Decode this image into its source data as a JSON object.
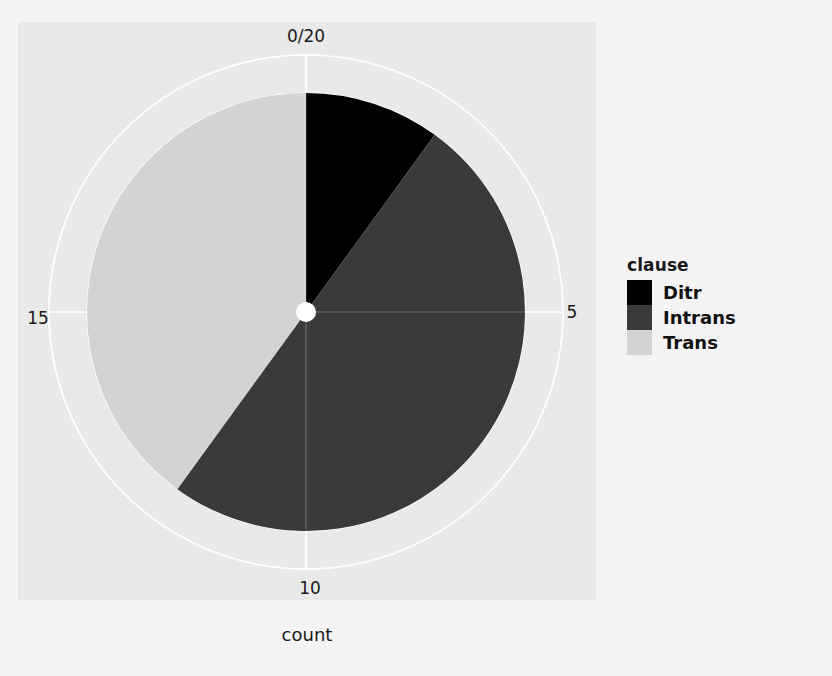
{
  "figure": {
    "axis_title": "count",
    "panel_color": "#e9e9e9",
    "background_color": "#f4f4f4",
    "grid_color": "#ffffff",
    "center_dot_color": "#ffffff"
  },
  "legend": {
    "title": "clause",
    "entries": [
      {
        "label": "Ditr",
        "color": "#000000"
      },
      {
        "label": "Intrans",
        "color": "#3a3a3a"
      },
      {
        "label": "Trans",
        "color": "#d3d3d3"
      }
    ]
  },
  "axis": {
    "ticks": [
      {
        "label": "0/20",
        "value": 0,
        "position": "top"
      },
      {
        "label": "5",
        "value": 5,
        "position": "right"
      },
      {
        "label": "10",
        "value": 10,
        "position": "bottom"
      },
      {
        "label": "15",
        "value": 15,
        "position": "left"
      }
    ]
  },
  "chart_data": {
    "type": "pie",
    "title": "",
    "xlabel": "count",
    "ylabel": "",
    "total": 20,
    "angular_axis_max": 20,
    "start_angle_deg": 0,
    "direction": "clockwise",
    "grid": true,
    "legend_position": "right",
    "legend_title": "clause",
    "categories": [
      "Ditr",
      "Intrans",
      "Trans"
    ],
    "values": [
      2,
      10,
      8
    ],
    "colors": [
      "#000000",
      "#3a3a3a",
      "#d3d3d3"
    ],
    "slices": [
      {
        "label": "Ditr",
        "value": 2,
        "color": "#000000",
        "start_deg": 0,
        "end_deg": 36
      },
      {
        "label": "Intrans",
        "value": 10,
        "color": "#3a3a3a",
        "start_deg": 36,
        "end_deg": 216
      },
      {
        "label": "Trans",
        "value": 8,
        "color": "#d3d3d3",
        "start_deg": 216,
        "end_deg": 360
      }
    ]
  },
  "geometry": {
    "center_x": 306,
    "center_y": 312,
    "pie_radius": 219,
    "grid_radius": 257,
    "center_dot_radius": 10
  }
}
